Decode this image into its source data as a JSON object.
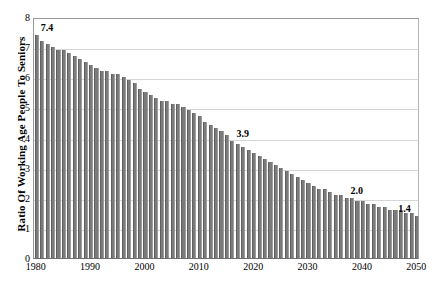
{
  "chart_data": {
    "type": "bar",
    "title": "",
    "xlabel": "",
    "ylabel": "Ratio Of Working Age People To Seniors",
    "ylim": [
      0,
      8
    ],
    "xlim": [
      1980,
      2050
    ],
    "grid": true,
    "legend": false,
    "bar_color": "#7b7b7b",
    "y_ticks": [
      "0",
      "1",
      "2",
      "3",
      "4",
      "5",
      "6",
      "7",
      "8"
    ],
    "y_tick_values": [
      0,
      1,
      2,
      3,
      4,
      5,
      6,
      7,
      8
    ],
    "x_ticks": [
      "1980",
      "1990",
      "2000",
      "2010",
      "2020",
      "2030",
      "2040",
      "2050"
    ],
    "x_tick_values": [
      1980,
      1990,
      2000,
      2010,
      2020,
      2030,
      2040,
      2050
    ],
    "categories": [
      1980,
      1981,
      1982,
      1983,
      1984,
      1985,
      1986,
      1987,
      1988,
      1989,
      1990,
      1991,
      1992,
      1993,
      1994,
      1995,
      1996,
      1997,
      1998,
      1999,
      2000,
      2001,
      2002,
      2003,
      2004,
      2005,
      2006,
      2007,
      2008,
      2009,
      2010,
      2011,
      2012,
      2013,
      2014,
      2015,
      2016,
      2017,
      2018,
      2019,
      2020,
      2021,
      2022,
      2023,
      2024,
      2025,
      2026,
      2027,
      2028,
      2029,
      2030,
      2031,
      2032,
      2033,
      2034,
      2035,
      2036,
      2037,
      2038,
      2039,
      2040,
      2041,
      2042,
      2043,
      2044,
      2045,
      2046,
      2047,
      2048,
      2049,
      2050
    ],
    "values": [
      7.4,
      7.2,
      7.1,
      7.0,
      6.9,
      6.9,
      6.8,
      6.7,
      6.6,
      6.5,
      6.4,
      6.3,
      6.2,
      6.2,
      6.1,
      6.1,
      6.0,
      5.9,
      5.8,
      5.6,
      5.5,
      5.4,
      5.3,
      5.2,
      5.2,
      5.1,
      5.1,
      5.0,
      4.9,
      4.8,
      4.7,
      4.5,
      4.4,
      4.3,
      4.2,
      4.1,
      3.9,
      3.8,
      3.7,
      3.6,
      3.5,
      3.4,
      3.3,
      3.2,
      3.1,
      3.0,
      2.9,
      2.8,
      2.7,
      2.6,
      2.5,
      2.4,
      2.3,
      2.3,
      2.2,
      2.1,
      2.1,
      2.0,
      2.0,
      1.9,
      1.9,
      1.8,
      1.8,
      1.7,
      1.7,
      1.6,
      1.6,
      1.6,
      1.5,
      1.5,
      1.4
    ],
    "annotations": [
      {
        "label": "7.4",
        "x": 1980,
        "y": 7.4
      },
      {
        "label": "3.9",
        "x": 2016,
        "y": 3.9
      },
      {
        "label": "2.0",
        "x": 2037,
        "y": 2.0
      },
      {
        "label": "1.4",
        "x": 2050,
        "y": 1.4
      }
    ]
  }
}
